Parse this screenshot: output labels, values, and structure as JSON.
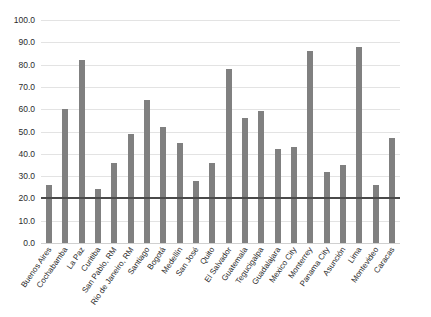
{
  "chart_data": {
    "type": "bar",
    "title": "",
    "subtitle": "",
    "xlabel": "",
    "ylabel": "",
    "ylim": [
      0.0,
      100.0
    ],
    "ytick_step": 10.0,
    "yticks": [
      "0.0",
      "10.0",
      "20.0",
      "30.0",
      "40.0",
      "50.0",
      "60.0",
      "70.0",
      "80.0",
      "90.0",
      "100.0"
    ],
    "grid": true,
    "legend": "none",
    "reference_line": {
      "value": 20.0,
      "label": ""
    },
    "categories": [
      "Buenos Aires",
      "Cochabamba",
      "La Paz",
      "Curitiba",
      "San Pablo, RM",
      "Rio de Janeiro, RM",
      "Santiago",
      "Bogotá",
      "Medellín",
      "San José",
      "Quito",
      "El Salvador",
      "Guatemala",
      "Tegucigalpa",
      "Guadalajara",
      "Mexico City",
      "Monterrey",
      "Panama City",
      "Asunción",
      "Lima",
      "Montevideo",
      "Caracas"
    ],
    "values": [
      26,
      60,
      82,
      24,
      36,
      49,
      64,
      52,
      45,
      28,
      36,
      78,
      56,
      59,
      42,
      43,
      86,
      32,
      35,
      88,
      26,
      47
    ],
    "series": [
      {
        "name": "",
        "values": [
          26,
          60,
          82,
          24,
          36,
          49,
          64,
          52,
          45,
          28,
          36,
          78,
          56,
          59,
          42,
          43,
          86,
          32,
          35,
          88,
          26,
          47
        ]
      }
    ]
  },
  "colors": {
    "bar": "#808080",
    "reference_line": "#4a4a4a",
    "gridline": "#e3e3e3",
    "background": "#ffffff",
    "text": "#2b2b2b"
  }
}
